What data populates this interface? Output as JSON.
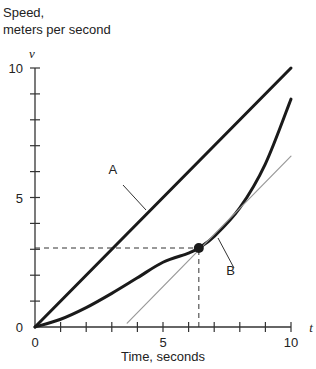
{
  "chart_data": {
    "type": "line",
    "title": "",
    "ylabel_line1": "Speed,",
    "ylabel_line2": "meters per second",
    "xlabel": "Time, seconds",
    "y_var": "v",
    "x_var": "t",
    "xlim": [
      0,
      10
    ],
    "ylim": [
      0,
      10
    ],
    "x_tick_labels": [
      "0",
      "5",
      "10"
    ],
    "y_tick_labels": [
      "0",
      "5",
      "10"
    ],
    "x_minor_ticks": [
      1,
      2,
      3,
      4,
      5,
      6,
      7,
      8,
      9,
      10
    ],
    "y_minor_ticks": [
      1,
      2,
      3,
      4,
      5,
      6,
      7,
      8,
      9,
      10
    ],
    "grid": false,
    "series": [
      {
        "name": "A",
        "style": "solid thick black",
        "x": [
          0,
          10
        ],
        "y": [
          0,
          10
        ]
      },
      {
        "name": "B",
        "style": "solid thick black curve",
        "x": [
          0,
          1,
          2,
          3,
          4,
          5,
          6,
          6.4,
          7,
          8,
          9,
          10
        ],
        "y": [
          0,
          0.3,
          0.75,
          1.3,
          1.9,
          2.5,
          2.85,
          3.05,
          3.5,
          4.6,
          6.3,
          8.8
        ]
      },
      {
        "name": "tangent",
        "style": "thin gray",
        "x": [
          3.6,
          10
        ],
        "y": [
          0.15,
          6.6
        ]
      }
    ],
    "annotations": [
      {
        "type": "point",
        "x": 6.4,
        "y": 3.05,
        "label": "tangent point on B"
      },
      {
        "type": "dashed_hline",
        "y": 3.05,
        "x_from": 0,
        "x_to": 6.4
      },
      {
        "type": "dashed_vline",
        "x": 6.4,
        "y_from": 0,
        "y_to": 3.05
      },
      {
        "type": "label",
        "text": "A",
        "x": 3.2,
        "y": 5.9
      },
      {
        "type": "label",
        "text": "B",
        "x": 7.8,
        "y": 2.0
      }
    ]
  }
}
